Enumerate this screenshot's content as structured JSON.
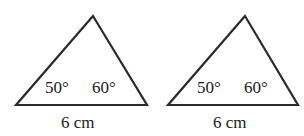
{
  "figures": [
    {
      "id": "triangle-1",
      "angles": {
        "left": "50°",
        "right": "60°"
      },
      "base_label": "6 cm"
    },
    {
      "id": "triangle-2",
      "angles": {
        "left": "50°",
        "right": "60°"
      },
      "base_label": "6 cm"
    }
  ],
  "colors": {
    "stroke": "#2a2a2a",
    "background": "#ffffff"
  }
}
